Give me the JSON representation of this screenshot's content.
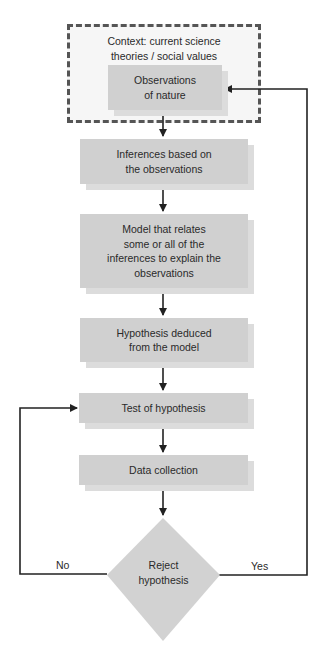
{
  "diagram": {
    "type": "flowchart",
    "context": {
      "label": "Context: current science theories / social values",
      "line1": "Context: current science",
      "line2": "theories / social values",
      "style": "dashed-border"
    },
    "nodes": [
      {
        "id": "observations",
        "line1": "Observations",
        "line2": "of nature",
        "text": "Observations of nature"
      },
      {
        "id": "inferences",
        "line1": "Inferences based on",
        "line2": "the observations",
        "text": "Inferences based on the observations"
      },
      {
        "id": "model",
        "line1": "Model that relates",
        "line2": "some or all of the",
        "line3": "inferences to explain the",
        "line4": "observations",
        "text": "Model that relates some or all of the inferences to explain the observations"
      },
      {
        "id": "hypothesis",
        "line1": "Hypothesis deduced",
        "line2": "from the model",
        "text": "Hypothesis deduced from the model"
      },
      {
        "id": "test",
        "line1": "Test of hypothesis",
        "text": "Test of hypothesis"
      },
      {
        "id": "data",
        "line1": "Data collection",
        "text": "Data collection"
      }
    ],
    "decision": {
      "id": "reject",
      "line1": "Reject",
      "line2": "hypothesis",
      "text": "Reject hypothesis",
      "no_label": "No",
      "yes_label": "Yes"
    },
    "edges": [
      {
        "from": "observations",
        "to": "inferences"
      },
      {
        "from": "inferences",
        "to": "model"
      },
      {
        "from": "model",
        "to": "hypothesis"
      },
      {
        "from": "hypothesis",
        "to": "test"
      },
      {
        "from": "test",
        "to": "data"
      },
      {
        "from": "data",
        "to": "reject"
      },
      {
        "from": "reject",
        "to": "test",
        "label": "No"
      },
      {
        "from": "reject",
        "to": "observations",
        "label": "Yes"
      }
    ],
    "colors": {
      "node_fill": "#d0d0d0",
      "node_shadow": "#dcdcdc",
      "context_border": "#555555",
      "line": "#222222"
    }
  }
}
